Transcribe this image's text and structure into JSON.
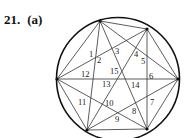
{
  "problem": {
    "number": "21.",
    "part": "(a)"
  },
  "diagram": {
    "type": "circle-with-complete-graph-chords",
    "circle": {
      "cx": 118,
      "cy": 79,
      "r": 61.5,
      "stroke": "#111111"
    },
    "points": [
      {
        "id": "A",
        "x": 100,
        "y": 21
      },
      {
        "id": "B",
        "x": 147,
        "y": 29
      },
      {
        "id": "C",
        "x": 178,
        "y": 79
      },
      {
        "id": "D",
        "x": 147,
        "y": 129
      },
      {
        "id": "E",
        "x": 87,
        "y": 130
      },
      {
        "id": "F",
        "x": 57,
        "y": 79
      }
    ],
    "chords": [
      [
        "A",
        "B"
      ],
      [
        "A",
        "C"
      ],
      [
        "A",
        "D"
      ],
      [
        "A",
        "E"
      ],
      [
        "A",
        "F"
      ],
      [
        "B",
        "C"
      ],
      [
        "B",
        "D"
      ],
      [
        "B",
        "E"
      ],
      [
        "B",
        "F"
      ],
      [
        "C",
        "D"
      ],
      [
        "C",
        "E"
      ],
      [
        "C",
        "F"
      ],
      [
        "D",
        "E"
      ],
      [
        "D",
        "F"
      ],
      [
        "E",
        "F"
      ]
    ],
    "region_labels": [
      {
        "text": "1",
        "x": 89,
        "y": 57
      },
      {
        "text": "2",
        "x": 97,
        "y": 63
      },
      {
        "text": "3",
        "x": 115,
        "y": 54
      },
      {
        "text": "4",
        "x": 134,
        "y": 57
      },
      {
        "text": "5",
        "x": 141,
        "y": 64
      },
      {
        "text": "6",
        "x": 149,
        "y": 79
      },
      {
        "text": "7",
        "x": 150,
        "y": 105
      },
      {
        "text": "8",
        "x": 132,
        "y": 114
      },
      {
        "text": "9",
        "x": 115,
        "y": 122
      },
      {
        "text": "10",
        "x": 105,
        "y": 106
      },
      {
        "text": "11",
        "x": 78,
        "y": 105
      },
      {
        "text": "12",
        "x": 81,
        "y": 77
      },
      {
        "text": "13",
        "x": 102,
        "y": 87
      },
      {
        "text": "14",
        "x": 131,
        "y": 88
      },
      {
        "text": "15",
        "x": 110,
        "y": 74
      }
    ]
  }
}
